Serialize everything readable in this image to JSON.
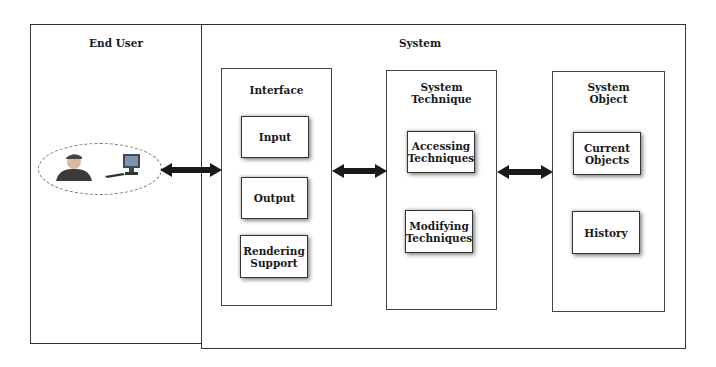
{
  "diagram": {
    "end_user": {
      "title": "End User",
      "icons": [
        "person-icon",
        "computer-icon"
      ]
    },
    "system": {
      "title": "System",
      "panels": [
        {
          "title": "Interface",
          "items": [
            "Input",
            "Output",
            "Rendering\nSupport"
          ]
        },
        {
          "title": "System\nTechnique",
          "items": [
            "Accessing\nTechniques",
            "Modifying\nTechniques"
          ]
        },
        {
          "title": "System\nObject",
          "items": [
            "Current\nObjects",
            "History"
          ]
        }
      ]
    },
    "connectors": [
      {
        "from": "End User",
        "to": "Interface",
        "type": "bidirectional-arrow"
      },
      {
        "from": "Interface",
        "to": "System Technique",
        "type": "bidirectional-arrow"
      },
      {
        "from": "System Technique",
        "to": "System Object",
        "type": "bidirectional-arrow"
      }
    ],
    "colors": {
      "border": "#333333",
      "arrow": "#1a1a1a",
      "ellipse": "#777777"
    }
  }
}
